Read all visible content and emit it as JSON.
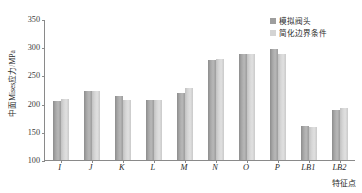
{
  "chart_data": {
    "type": "bar",
    "title": "",
    "xlabel": "特征点",
    "ylabel": "中面Mises应力/MPa",
    "categories": [
      "I",
      "J",
      "K",
      "L",
      "M",
      "N",
      "O",
      "P",
      "LB1",
      "LB2"
    ],
    "series": [
      {
        "name": "模拟阀头",
        "color": "#9e9e9e",
        "values": [
          204,
          223,
          214,
          207,
          219,
          278,
          288,
          296,
          161,
          189
        ]
      },
      {
        "name": "简化边界条件",
        "color": "#d4d4d4",
        "values": [
          209,
          223,
          207,
          207,
          227,
          279,
          288,
          288,
          158,
          193
        ]
      }
    ],
    "ylim": [
      100,
      350
    ],
    "yticks": [
      100,
      150,
      200,
      250,
      300,
      350
    ],
    "ytick_labels": [
      "100",
      "150",
      "200",
      "250",
      "300",
      "350"
    ],
    "grid": false,
    "legend_position": "top-right"
  }
}
